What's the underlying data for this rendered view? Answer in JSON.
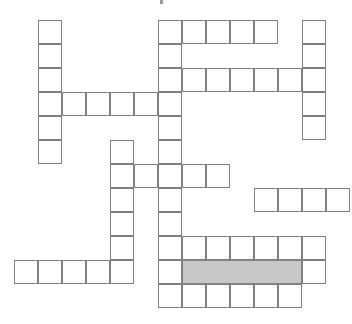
{
  "puzzle": {
    "title": "Crossword Grid",
    "type": "crossword-grid",
    "description": "Blank crossword puzzle grid with one horizontally shaded answer band",
    "canvas": {
      "width": 352,
      "height": 324
    },
    "geometry": {
      "cell_size": 24,
      "origin_x": 14,
      "origin_y": 20,
      "columns": 14,
      "rows": 12,
      "line_color": "#808080",
      "empty_color": "#ffffff",
      "shaded_color": "#c8c8c8"
    },
    "counts": {
      "total_cells": 71,
      "white_cells": 66,
      "shaded_cells": 5
    },
    "entries": [
      {
        "name": "row0-band",
        "orientation": "across",
        "row": 0,
        "col_start": 6,
        "length": 5,
        "shaded": false
      },
      {
        "name": "row0-right-single",
        "orientation": "across",
        "row": 0,
        "col_start": 12,
        "length": 1,
        "shaded": false
      },
      {
        "name": "row2-band",
        "orientation": "across",
        "row": 2,
        "col_start": 6,
        "length": 7,
        "shaded": false
      },
      {
        "name": "row3-band",
        "orientation": "across",
        "row": 3,
        "col_start": 1,
        "length": 6,
        "shaded": false
      },
      {
        "name": "row6-band",
        "orientation": "across",
        "row": 6,
        "col_start": 4,
        "length": 5,
        "shaded": false
      },
      {
        "name": "row7-right-band",
        "orientation": "across",
        "row": 7,
        "col_start": 10,
        "length": 4,
        "shaded": false
      },
      {
        "name": "row9-band",
        "orientation": "across",
        "row": 9,
        "col_start": 6,
        "length": 6,
        "shaded": false
      },
      {
        "name": "row10-shaded-band",
        "orientation": "across",
        "row": 10,
        "col_start": 7,
        "length": 5,
        "shaded": true
      },
      {
        "name": "row10-left-cell",
        "orientation": "across",
        "row": 10,
        "col_start": 6,
        "length": 1,
        "shaded": false
      },
      {
        "name": "row10-right-cell",
        "orientation": "across",
        "row": 10,
        "col_start": 12,
        "length": 1,
        "shaded": false
      },
      {
        "name": "row10-bottom-left-band",
        "orientation": "across",
        "row": 10,
        "col_start": 0,
        "length": 5,
        "shaded": false
      },
      {
        "name": "row11-band",
        "orientation": "across",
        "row": 11,
        "col_start": 6,
        "length": 6,
        "shaded": false
      },
      {
        "name": "left-column",
        "orientation": "down",
        "col": 1,
        "row_start": 0,
        "length": 6,
        "shaded": false
      },
      {
        "name": "center-column",
        "orientation": "down",
        "col": 6,
        "row_start": 0,
        "length": 12,
        "shaded": false
      },
      {
        "name": "right-column",
        "orientation": "down",
        "col": 12,
        "row_start": 0,
        "length": 5,
        "shaded": false
      },
      {
        "name": "mid-column",
        "orientation": "down",
        "col": 4,
        "row_start": 5,
        "length": 6,
        "shaded": false
      }
    ],
    "cells": [
      {
        "r": 0,
        "c": 1,
        "shaded": false
      },
      {
        "r": 0,
        "c": 6,
        "shaded": false
      },
      {
        "r": 0,
        "c": 7,
        "shaded": false
      },
      {
        "r": 0,
        "c": 8,
        "shaded": false
      },
      {
        "r": 0,
        "c": 9,
        "shaded": false
      },
      {
        "r": 0,
        "c": 10,
        "shaded": false
      },
      {
        "r": 0,
        "c": 12,
        "shaded": false
      },
      {
        "r": 1,
        "c": 1,
        "shaded": false
      },
      {
        "r": 1,
        "c": 6,
        "shaded": false
      },
      {
        "r": 1,
        "c": 12,
        "shaded": false
      },
      {
        "r": 2,
        "c": 1,
        "shaded": false
      },
      {
        "r": 2,
        "c": 6,
        "shaded": false
      },
      {
        "r": 2,
        "c": 7,
        "shaded": false
      },
      {
        "r": 2,
        "c": 8,
        "shaded": false
      },
      {
        "r": 2,
        "c": 9,
        "shaded": false
      },
      {
        "r": 2,
        "c": 10,
        "shaded": false
      },
      {
        "r": 2,
        "c": 11,
        "shaded": false
      },
      {
        "r": 2,
        "c": 12,
        "shaded": false
      },
      {
        "r": 3,
        "c": 1,
        "shaded": false
      },
      {
        "r": 3,
        "c": 2,
        "shaded": false
      },
      {
        "r": 3,
        "c": 3,
        "shaded": false
      },
      {
        "r": 3,
        "c": 4,
        "shaded": false
      },
      {
        "r": 3,
        "c": 5,
        "shaded": false
      },
      {
        "r": 3,
        "c": 6,
        "shaded": false
      },
      {
        "r": 3,
        "c": 12,
        "shaded": false
      },
      {
        "r": 4,
        "c": 1,
        "shaded": false
      },
      {
        "r": 4,
        "c": 6,
        "shaded": false
      },
      {
        "r": 4,
        "c": 12,
        "shaded": false
      },
      {
        "r": 5,
        "c": 1,
        "shaded": false
      },
      {
        "r": 5,
        "c": 4,
        "shaded": false
      },
      {
        "r": 5,
        "c": 6,
        "shaded": false
      },
      {
        "r": 6,
        "c": 4,
        "shaded": false
      },
      {
        "r": 6,
        "c": 5,
        "shaded": false
      },
      {
        "r": 6,
        "c": 6,
        "shaded": false
      },
      {
        "r": 6,
        "c": 7,
        "shaded": false
      },
      {
        "r": 6,
        "c": 8,
        "shaded": false
      },
      {
        "r": 7,
        "c": 4,
        "shaded": false
      },
      {
        "r": 7,
        "c": 6,
        "shaded": false
      },
      {
        "r": 7,
        "c": 10,
        "shaded": false
      },
      {
        "r": 7,
        "c": 11,
        "shaded": false
      },
      {
        "r": 7,
        "c": 12,
        "shaded": false
      },
      {
        "r": 7,
        "c": 13,
        "shaded": false
      },
      {
        "r": 8,
        "c": 4,
        "shaded": false
      },
      {
        "r": 8,
        "c": 6,
        "shaded": false
      },
      {
        "r": 9,
        "c": 4,
        "shaded": false
      },
      {
        "r": 9,
        "c": 6,
        "shaded": false
      },
      {
        "r": 9,
        "c": 7,
        "shaded": false
      },
      {
        "r": 9,
        "c": 8,
        "shaded": false
      },
      {
        "r": 9,
        "c": 9,
        "shaded": false
      },
      {
        "r": 9,
        "c": 10,
        "shaded": false
      },
      {
        "r": 9,
        "c": 11,
        "shaded": false
      },
      {
        "r": 9,
        "c": 12,
        "shaded": false
      },
      {
        "r": 10,
        "c": 0,
        "shaded": false
      },
      {
        "r": 10,
        "c": 1,
        "shaded": false
      },
      {
        "r": 10,
        "c": 2,
        "shaded": false
      },
      {
        "r": 10,
        "c": 3,
        "shaded": false
      },
      {
        "r": 10,
        "c": 4,
        "shaded": false
      },
      {
        "r": 10,
        "c": 6,
        "shaded": false
      },
      {
        "r": 10,
        "c": 7,
        "shaded": true
      },
      {
        "r": 10,
        "c": 8,
        "shaded": true
      },
      {
        "r": 10,
        "c": 9,
        "shaded": true
      },
      {
        "r": 10,
        "c": 10,
        "shaded": true
      },
      {
        "r": 10,
        "c": 11,
        "shaded": true
      },
      {
        "r": 10,
        "c": 12,
        "shaded": false
      },
      {
        "r": 11,
        "c": 6,
        "shaded": false
      },
      {
        "r": 11,
        "c": 7,
        "shaded": false
      },
      {
        "r": 11,
        "c": 8,
        "shaded": false
      },
      {
        "r": 11,
        "c": 9,
        "shaded": false
      },
      {
        "r": 11,
        "c": 10,
        "shaded": false
      },
      {
        "r": 11,
        "c": 11,
        "shaded": false
      }
    ],
    "artifacts": [
      {
        "name": "top-speck",
        "x": 160,
        "y": 0,
        "w": 3,
        "h": 4
      }
    ]
  }
}
